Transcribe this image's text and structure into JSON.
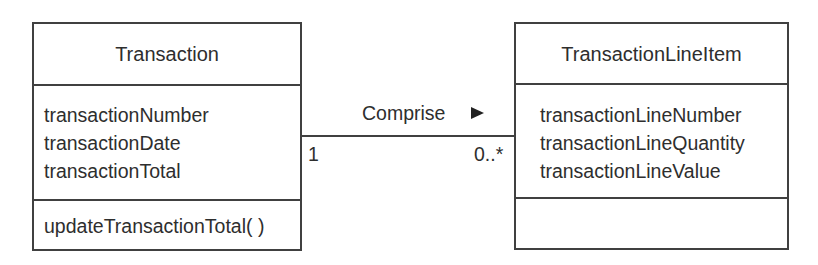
{
  "classes": [
    {
      "name": "Transaction",
      "attributes": [
        "transactionNumber",
        "transactionDate",
        "transactionTotal"
      ],
      "operations": [
        "updateTransactionTotal( )"
      ]
    },
    {
      "name": "TransactionLineItem",
      "attributes": [
        "transactionLineNumber",
        "transactionLineQuantity",
        "transactionLineValue"
      ],
      "operations": []
    }
  ],
  "association": {
    "name": "Comprise",
    "direction_icon": "triangle-right-icon",
    "source_multiplicity": "1",
    "target_multiplicity": "0..*"
  },
  "colors": {
    "line": "#404040",
    "text": "#2e2e2e",
    "background": "#ffffff"
  }
}
